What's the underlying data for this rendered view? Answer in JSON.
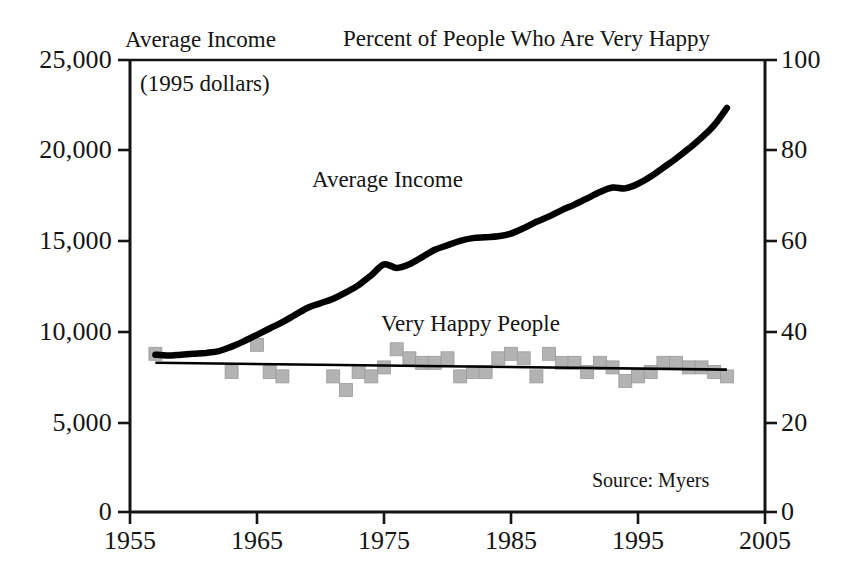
{
  "headers": {
    "left_title": "Average Income",
    "right_title": "Percent of People Who Are Very Happy",
    "units_note": "(1995 dollars)"
  },
  "annotations": {
    "income_series_label": "Average Income",
    "happy_series_label": "Very Happy People",
    "source": "Source: Myers"
  },
  "axes": {
    "y_left_ticks": [
      "25,000",
      "20,000",
      "15,000",
      "10,000",
      "5,000",
      "0"
    ],
    "y_right_ticks": [
      "100",
      "80",
      "60",
      "40",
      "20",
      "0"
    ],
    "x_ticks": [
      "1955",
      "1965",
      "1975",
      "1985",
      "1995",
      "2005"
    ]
  },
  "colors": {
    "ink": "#141414",
    "line": "#000000",
    "marker": "#b3b3b3",
    "marker_edge": "#9a9a9a",
    "frame": "#141414",
    "background": "#ffffff"
  },
  "chart_data": {
    "type": "line",
    "title": "Percent of People Who Are Very Happy",
    "subtitle": "Average Income",
    "xlabel": "",
    "ylabel": "Average Income (1995 dollars)",
    "ylabel_right": "Percent of People Who Are Very Happy",
    "xlim": [
      1955,
      2005
    ],
    "ylim": [
      0,
      25000
    ],
    "ylim_right": [
      0,
      100
    ],
    "grid": false,
    "legend": "inline annotations",
    "series": [
      {
        "name": "Average Income",
        "type": "line",
        "axis": "left",
        "units": "1995 dollars",
        "color": "#000000",
        "x": [
          1957,
          1958,
          1959,
          1960,
          1961,
          1962,
          1963,
          1964,
          1965,
          1966,
          1967,
          1968,
          1969,
          1970,
          1971,
          1972,
          1973,
          1974,
          1975,
          1976,
          1977,
          1978,
          1979,
          1980,
          1981,
          1982,
          1983,
          1984,
          1985,
          1986,
          1987,
          1988,
          1989,
          1990,
          1991,
          1992,
          1993,
          1994,
          1995,
          1996,
          1997,
          1998,
          1999,
          2000,
          2001,
          2002
        ],
        "y": [
          8700,
          8650,
          8700,
          8750,
          8800,
          8900,
          9150,
          9450,
          9800,
          10150,
          10500,
          10900,
          11300,
          11550,
          11800,
          12150,
          12550,
          13100,
          13700,
          13500,
          13700,
          14100,
          14500,
          14750,
          15000,
          15150,
          15200,
          15250,
          15400,
          15700,
          16050,
          16350,
          16700,
          17000,
          17350,
          17700,
          17950,
          17900,
          18150,
          18550,
          19050,
          19550,
          20100,
          20700,
          21400,
          22350
        ]
      },
      {
        "name": "Very Happy People",
        "type": "scatter",
        "axis": "right",
        "units": "percent",
        "color": "#b3b3b3",
        "x": [
          1957,
          1963,
          1965,
          1966,
          1967,
          1971,
          1972,
          1973,
          1974,
          1975,
          1976,
          1977,
          1978,
          1979,
          1980,
          1981,
          1982,
          1983,
          1984,
          1985,
          1986,
          1987,
          1988,
          1989,
          1990,
          1991,
          1992,
          1993,
          1994,
          1995,
          1996,
          1997,
          1998,
          1999,
          2000,
          2001,
          2002
        ],
        "y": [
          35,
          31,
          37,
          31,
          30,
          30,
          27,
          31,
          30,
          32,
          36,
          34,
          33,
          33,
          34,
          30,
          31,
          31,
          34,
          35,
          34,
          30,
          35,
          33,
          33,
          31,
          33,
          32,
          29,
          30,
          31,
          33,
          33,
          32,
          32,
          31,
          30
        ]
      },
      {
        "name": "Very Happy People trend",
        "type": "line",
        "axis": "right",
        "color": "#000000",
        "x": [
          1957,
          2002
        ],
        "y": [
          33.0,
          31.5
        ]
      }
    ]
  }
}
